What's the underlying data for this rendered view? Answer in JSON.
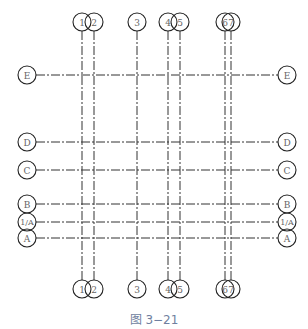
{
  "figure": {
    "caption": "图 3−21",
    "colors": {
      "line": "#333333",
      "label": "#666666",
      "caption": "#6f7fa0"
    }
  },
  "vertical_axes": [
    {
      "label": "1"
    },
    {
      "label": "2"
    },
    {
      "label": "3"
    },
    {
      "label": "4"
    },
    {
      "label": "5"
    },
    {
      "label": "6"
    },
    {
      "label": "7"
    }
  ],
  "horizontal_axes": [
    {
      "label": "E"
    },
    {
      "label": "D"
    },
    {
      "label": "C"
    },
    {
      "label": "B"
    },
    {
      "label": "1/A"
    },
    {
      "label": "A"
    }
  ]
}
